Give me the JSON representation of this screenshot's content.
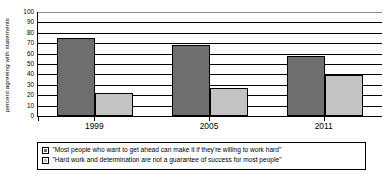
{
  "chart_data": {
    "type": "bar",
    "title": "",
    "subtitle": "",
    "xlabel": "",
    "ylabel": "percent agreeing with statements",
    "categories": [
      "1999",
      "2005",
      "2011"
    ],
    "ylim": [
      0,
      100
    ],
    "yticks": [
      "0",
      "10",
      "20",
      "30",
      "40",
      "50",
      "60",
      "70",
      "80",
      "90",
      "100"
    ],
    "grid": true,
    "legend_position": "bottom",
    "series": [
      {
        "name": "\"Most people who want to get ahead can make it if they're willing to work hard\"",
        "color": "#6e6e6e",
        "values": [
          75,
          68,
          58
        ]
      },
      {
        "name": "\"Hard work and determination are not a guarantee of success for most people\"",
        "color": "#c3c3c3",
        "values": [
          22,
          27,
          39
        ]
      }
    ]
  },
  "legend": {
    "entries": [
      {
        "label": "\"Most people who want to get ahead can make it if they're willing to work hard\"",
        "swatch": "legend-swatch-dark"
      },
      {
        "label": "\"Hard work and determination are not a guarantee of success for most people\"",
        "swatch": "legend-swatch-light"
      }
    ]
  },
  "axes": {
    "y_title": "percent agreeing with statements",
    "y_ticks": [
      "100",
      "90",
      "80",
      "70",
      "60",
      "50",
      "40",
      "30",
      "20",
      "10",
      "0"
    ],
    "x_ticks": [
      "1999",
      "2005",
      "2011"
    ]
  }
}
